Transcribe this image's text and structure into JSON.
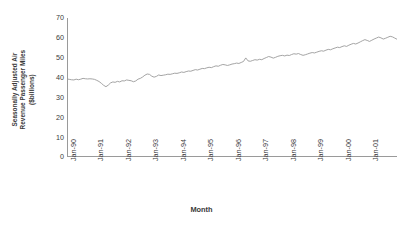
{
  "chart_data": {
    "type": "line",
    "title": "",
    "xlabel": "Month",
    "ylabel": "Seasonally Adjusted Air Revenue Passenger Miles ($billions)",
    "ylabel_line1": "Seasonally Adjusted Air",
    "ylabel_line2": "Revenue Passenger Miles",
    "ylabel_line3": "($billions)",
    "ylim": [
      0,
      70
    ],
    "ytick_labels": [
      "70",
      "60",
      "50",
      "40",
      "30",
      "20",
      "10",
      "0"
    ],
    "ytick_values": [
      70,
      60,
      50,
      40,
      30,
      20,
      10,
      0
    ],
    "xtick_labels": [
      "Jan-90",
      "Jan-91",
      "Jan-92",
      "Jan-93",
      "Jan-94",
      "Jan-95",
      "Jan-96",
      "Jan-97",
      "Jan-98",
      "Jan-99",
      "Jan-00",
      "Jan-01"
    ],
    "grid": false,
    "legend": "none",
    "line_color": "#9a9a9a",
    "axis_color": "#9a9a9a",
    "series": [
      {
        "name": "Seasonally Adjusted Air Revenue Passenger Miles",
        "x_start": "Jan-90",
        "x_frequency": "monthly",
        "values": [
          39.3,
          39.1,
          38.9,
          38.8,
          39.2,
          38.9,
          39.2,
          39.6,
          39.4,
          39.3,
          39.4,
          39.3,
          39.1,
          38.6,
          38.0,
          37.1,
          36.1,
          35.4,
          36.2,
          37.3,
          37.8,
          37.6,
          38.1,
          37.8,
          38.4,
          38.3,
          38.8,
          38.6,
          38.4,
          37.9,
          38.3,
          39.2,
          39.6,
          40.3,
          41.2,
          41.8,
          41.6,
          40.7,
          40.2,
          40.6,
          41.3,
          41.0,
          41.2,
          41.4,
          41.7,
          41.6,
          41.9,
          42.2,
          42.1,
          42.4,
          42.8,
          42.6,
          43.0,
          43.3,
          43.2,
          43.6,
          44.0,
          43.8,
          44.2,
          44.6,
          44.5,
          44.9,
          45.2,
          45.0,
          45.5,
          45.9,
          45.7,
          46.2,
          46.6,
          46.4,
          46.1,
          46.4,
          46.8,
          47.0,
          47.3,
          47.1,
          47.6,
          48.1,
          49.9,
          48.4,
          48.2,
          48.6,
          49.0,
          48.8,
          49.2,
          49.0,
          49.6,
          50.1,
          50.6,
          50.3,
          49.8,
          50.2,
          50.7,
          51.0,
          51.2,
          50.9,
          51.3,
          51.1,
          51.6,
          52.0,
          51.8,
          52.1,
          51.6,
          51.2,
          51.5,
          51.9,
          52.3,
          52.6,
          52.4,
          52.8,
          53.2,
          53.5,
          53.3,
          53.8,
          54.2,
          54.0,
          54.5,
          54.9,
          55.3,
          55.1,
          55.6,
          56.0,
          55.7,
          56.3,
          56.8,
          57.2,
          56.9,
          57.4,
          58.0,
          58.6,
          59.1,
          58.7,
          58.2,
          58.8,
          59.4,
          59.9,
          60.4,
          60.0,
          59.4,
          59.8,
          60.3,
          60.8,
          60.5,
          59.9,
          59.3,
          58.8,
          59.2,
          58.6,
          58.1,
          57.6
        ]
      }
    ]
  }
}
